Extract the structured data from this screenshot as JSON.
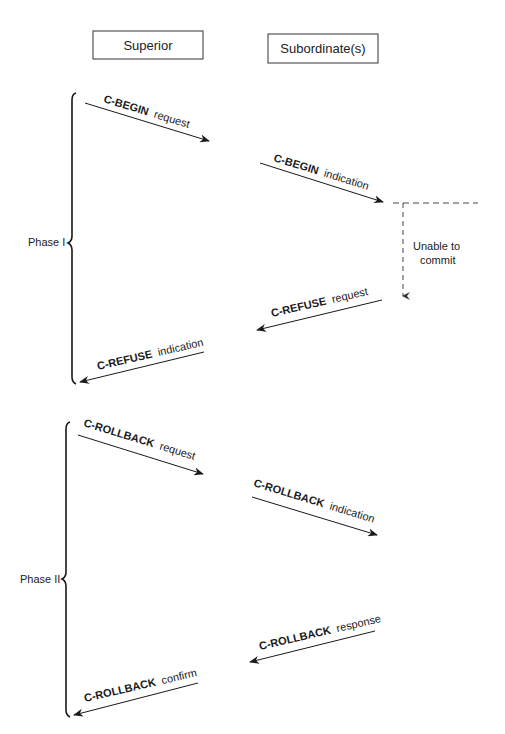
{
  "diagram": {
    "type": "sequence",
    "participants": [
      {
        "id": "superior",
        "label": "Superior"
      },
      {
        "id": "subordinate",
        "label": "Subordinate(s)"
      }
    ],
    "phases": [
      {
        "label": "Phase I",
        "messages": [
          {
            "name": "C-BEGIN",
            "suffix": "request",
            "direction": "right"
          },
          {
            "name": "C-BEGIN",
            "suffix": "indication",
            "direction": "right"
          },
          {
            "name": "C-REFUSE",
            "suffix": "request",
            "direction": "left"
          },
          {
            "name": "C-REFUSE",
            "suffix": "indication",
            "direction": "left"
          }
        ],
        "note": {
          "line1": "Unable to",
          "line2": "commit"
        }
      },
      {
        "label": "Phase II",
        "messages": [
          {
            "name": "C-ROLLBACK",
            "suffix": "request",
            "direction": "right"
          },
          {
            "name": "C-ROLLBACK",
            "suffix": "indication",
            "direction": "right"
          },
          {
            "name": "C-ROLLBACK",
            "suffix": "response",
            "direction": "left"
          },
          {
            "name": "C-ROLLBACK",
            "suffix": "confirm",
            "direction": "left"
          }
        ]
      }
    ]
  }
}
